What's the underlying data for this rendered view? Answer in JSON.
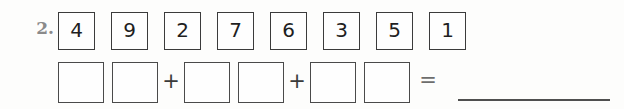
{
  "worksheet": {
    "problem_number": "2.",
    "digit_boxes": [
      {
        "value": "4"
      },
      {
        "value": "9"
      },
      {
        "value": "2"
      },
      {
        "value": "7"
      },
      {
        "value": "6"
      },
      {
        "value": "3"
      },
      {
        "value": "5"
      },
      {
        "value": "1"
      }
    ],
    "equation": {
      "addend_groups": 3,
      "boxes_per_group": 2,
      "empty_box_value": "",
      "plus_operator": "+",
      "equals_operator": "=",
      "answer_value": ""
    },
    "colors": {
      "background": "#fdfdfc",
      "box_border": "#3b3b3b",
      "empty_box_border": "#4a4a4a",
      "digit_text": "#1f1f1f",
      "problem_number_text": "#8a8a8a",
      "operator_text": "#3a3a3a",
      "answer_line": "#4f4f4f"
    }
  }
}
